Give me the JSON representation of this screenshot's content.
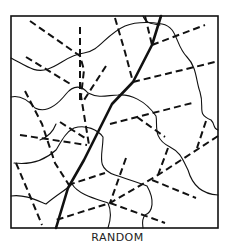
{
  "caption": "RANDOM",
  "colors": {
    "ink": "#111111",
    "background": "#ffffff"
  },
  "frame": {
    "x": 11,
    "y": 16,
    "width": 207,
    "height": 212
  },
  "main_stream": [
    {
      "d": "M56 228 L68 188 L84 160 L100 128 L112 104 L133 82 L152 45 L161 16",
      "w": 2.6
    }
  ],
  "dashed_streams": [
    {
      "d": "M30 21 L80 56 L84 70 L81 96 L89 145"
    },
    {
      "d": "M80 27 L80 100"
    },
    {
      "d": "M106 66 L84 100"
    },
    {
      "d": "M26 57 L72 85"
    },
    {
      "d": "M20 135 L87 145"
    },
    {
      "d": "M25 91 L42 124 L55 163 L69 185"
    },
    {
      "d": "M60 122 L88 140"
    },
    {
      "d": "M16 163 L30 196 L42 225"
    },
    {
      "d": "M115 18 L125 52 L133 82"
    },
    {
      "d": "M145 16 L152 45"
    },
    {
      "d": "M152 45 L205 25"
    },
    {
      "d": "M133 82 L215 62"
    },
    {
      "d": "M110 124 L192 103"
    },
    {
      "d": "M137 117 L165 137"
    },
    {
      "d": "M206 121 L197 148"
    },
    {
      "d": "M218 136 L158 175 L110 203 L56 220"
    },
    {
      "d": "M168 148 L158 175"
    },
    {
      "d": "M68 185 L105 173"
    },
    {
      "d": "M126 158 L110 203"
    },
    {
      "d": "M152 180 L196 198"
    },
    {
      "d": "M110 203 L165 223"
    }
  ],
  "contours": [
    {
      "d": "M11 58 C25 65 35 74 48 69 C62 64 68 55 84 53 C100 51 105 35 125 26 C138 21 150 22 162 24 C178 27 175 45 187 57 C197 67 196 82 200 92 C205 108 196 114 211 120 C216 125 212 128 218 130"
    },
    {
      "d": "M11 97 C20 95 28 100 35 108 C47 114 58 104 66 94 C74 84 82 86 88 93 C100 99 108 95 118 95 C130 94 145 100 156 116 C158 125 152 138 170 147 C180 152 182 158 188 170 C192 184 200 194 218 195"
    },
    {
      "d": "M14 163 C30 165 45 160 56 150 C62 140 66 132 74 128 C86 124 98 130 103 137 C103 155 95 168 115 175 C130 180 140 183 147 186 C155 200 153 212 145 215 C141 220 143 226 143 228"
    },
    {
      "d": "M11 196 C24 194 36 200 46 204 C58 194 66 190 72 184 C78 194 93 198 108 203 C112 212 110 222 108 228"
    },
    {
      "d": "M143 16 C145 22 150 24 160 25"
    },
    {
      "d": "M40 140 C48 137 53 132 56 124"
    }
  ]
}
